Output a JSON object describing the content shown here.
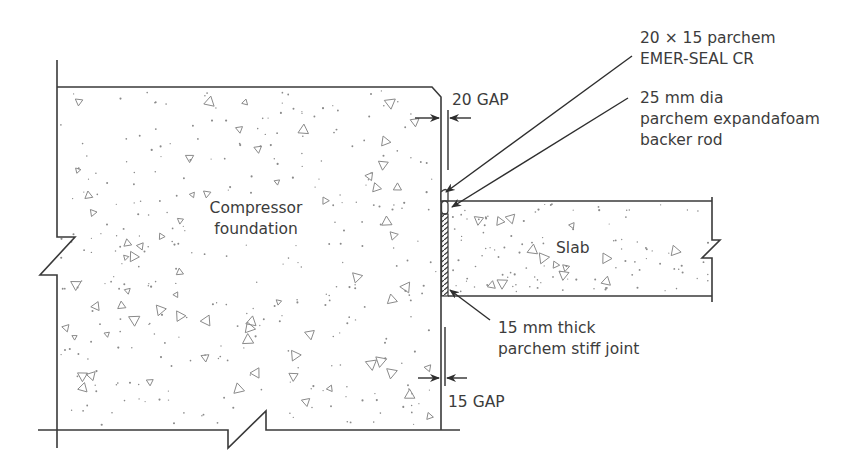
{
  "diagram": {
    "elements": {
      "foundation": {
        "label_line1": "Compressor",
        "label_line2": "foundation"
      },
      "slab": {
        "label": "Slab"
      }
    },
    "callouts": {
      "sealant": {
        "line1": "20 × 15 parchem",
        "line2": "EMER-SEAL CR"
      },
      "backer_rod": {
        "line1": "25 mm dia",
        "line2": "parchem expandafoam",
        "line3": "backer rod"
      },
      "stiff_joint": {
        "line1": "15 mm thick",
        "line2": "parchem stiff joint"
      }
    },
    "dimensions": {
      "top_gap": "20 GAP",
      "bottom_gap": "15 GAP"
    },
    "colors": {
      "line": "#3a3a3a",
      "aggregate": "#8a8a8a",
      "background": "#ffffff"
    }
  }
}
